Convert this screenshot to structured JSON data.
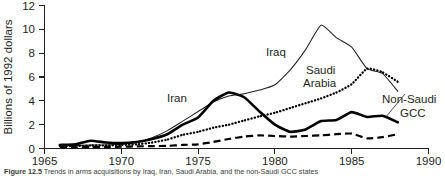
{
  "figure": {
    "caption_label": "Figure",
    "caption_number": "12.5",
    "caption_text": "Trends in arms acquisitions by Iraq, Iran, Saudi Arabia, and the non-Saudi GCC states"
  },
  "chart_data": {
    "type": "line",
    "title": "",
    "xlabel": "",
    "ylabel": "Billions of 1992 dollars",
    "xlim": [
      1965,
      1990
    ],
    "ylim": [
      0,
      12
    ],
    "xticks": [
      1965,
      1970,
      1975,
      1980,
      1985,
      1990
    ],
    "yticks": [
      0,
      2,
      4,
      6,
      8,
      10,
      12
    ],
    "grid": false,
    "legend_position": "inline-annotations",
    "series": [
      {
        "name": "Iran",
        "style": "thick-solid",
        "label_x": 1975.2,
        "label_y": 5.35,
        "x": [
          1966,
          1967,
          1968,
          1969,
          1970,
          1971,
          1972,
          1973,
          1974,
          1975,
          1976,
          1977,
          1978,
          1979,
          1980,
          1981,
          1982,
          1983,
          1984,
          1985,
          1986,
          1987,
          1988
        ],
        "values": [
          0.3,
          0.35,
          0.65,
          0.5,
          0.45,
          0.55,
          0.8,
          1.2,
          2.0,
          2.6,
          4.0,
          4.7,
          4.3,
          3.1,
          2.0,
          1.4,
          1.6,
          2.3,
          2.4,
          3.05,
          2.65,
          2.75,
          2.2
        ]
      },
      {
        "name": "Iraq",
        "style": "thin-solid",
        "label_x": 1977.6,
        "label_y": 8.1,
        "x": [
          1966,
          1967,
          1968,
          1969,
          1970,
          1971,
          1972,
          1973,
          1974,
          1975,
          1976,
          1977,
          1978,
          1979,
          1980,
          1981,
          1982,
          1983,
          1984,
          1985,
          1986,
          1987,
          1988
        ],
        "values": [
          0.2,
          0.25,
          0.3,
          0.3,
          0.35,
          0.5,
          0.9,
          1.5,
          2.3,
          3.1,
          3.9,
          4.4,
          4.6,
          4.9,
          5.35,
          6.6,
          8.3,
          10.35,
          9.3,
          8.5,
          6.7,
          6.3,
          4.8
        ]
      },
      {
        "name": "Saudi Arabia",
        "style": "dotted",
        "label_line1": "Saudi",
        "label_line2": "Arabia",
        "label_x": 1981.4,
        "label_y": 6.55,
        "x": [
          1966,
          1967,
          1968,
          1969,
          1970,
          1971,
          1972,
          1973,
          1974,
          1975,
          1976,
          1977,
          1978,
          1979,
          1980,
          1981,
          1982,
          1983,
          1984,
          1985,
          1986,
          1987,
          1988
        ],
        "values": [
          0.2,
          0.2,
          0.25,
          0.25,
          0.3,
          0.35,
          0.5,
          0.75,
          1.15,
          1.4,
          1.75,
          2.0,
          2.35,
          2.7,
          3.0,
          3.4,
          3.8,
          4.2,
          4.7,
          5.4,
          6.7,
          6.4,
          5.6
        ]
      },
      {
        "name": "Non-Saudi GCC",
        "style": "dashed",
        "label_line1": "Non-Saudi",
        "label_line2": "GCC",
        "label_x": 1987.3,
        "label_y": 3.9,
        "x": [
          1966,
          1967,
          1968,
          1969,
          1970,
          1971,
          1972,
          1973,
          1974,
          1975,
          1976,
          1977,
          1978,
          1979,
          1980,
          1981,
          1982,
          1983,
          1984,
          1985,
          1986,
          1987,
          1988
        ],
        "values": [
          0.1,
          0.1,
          0.12,
          0.12,
          0.15,
          0.18,
          0.2,
          0.22,
          0.3,
          0.35,
          0.55,
          0.8,
          1.0,
          1.1,
          1.05,
          1.0,
          1.05,
          1.1,
          1.2,
          1.25,
          0.85,
          0.95,
          1.2
        ]
      }
    ]
  }
}
